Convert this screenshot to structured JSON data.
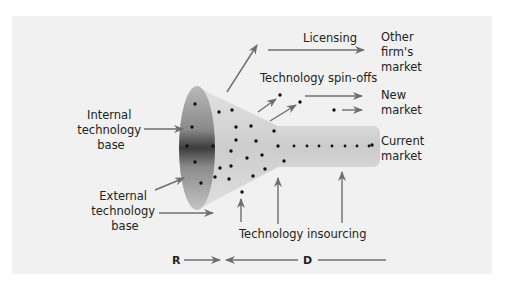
{
  "diagram": {
    "colors": {
      "panel": "#f1f1f1",
      "arrow": "#6e6e6e",
      "funnel_light": "#d6d6d6",
      "funnel_dark": "#4a4a4a",
      "tube": "#cfcfcf",
      "dot": "#111111",
      "text": "#222222"
    },
    "labels": {
      "internal_base": [
        "Internal",
        "technology",
        "base"
      ],
      "external_base": [
        "External",
        "technology",
        "base"
      ],
      "licensing": "Licensing",
      "spin_offs": "Technology spin-offs",
      "insourcing": "Technology insourcing",
      "other_market": [
        "Other",
        "firm's",
        "market"
      ],
      "new_market": [
        "New",
        "market"
      ],
      "current_market": [
        "Current",
        "market"
      ],
      "research": "R",
      "development": "D"
    }
  }
}
